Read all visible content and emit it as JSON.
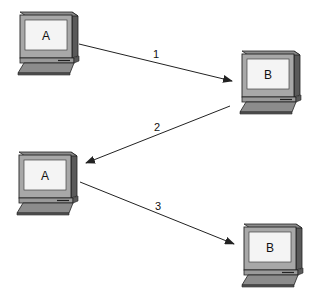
{
  "diagram": {
    "nodes": [
      {
        "id": "top-left",
        "label": "A",
        "x": 20,
        "y": 12
      },
      {
        "id": "top-right",
        "label": "B",
        "x": 242,
        "y": 51
      },
      {
        "id": "mid-left",
        "label": "A",
        "x": 19,
        "y": 152
      },
      {
        "id": "bottom-right",
        "label": "B",
        "x": 244,
        "y": 224
      }
    ],
    "arrows": [
      {
        "step": "1",
        "from": "top-left A",
        "to": "top-right B"
      },
      {
        "step": "2",
        "from": "top-right B",
        "to": "mid-left A"
      },
      {
        "step": "3",
        "from": "mid-left A",
        "to": "bottom-right B"
      }
    ],
    "colors": {
      "case_light": "#a8a8a8",
      "case_mid": "#8c8c8c",
      "case_dark": "#5a5a5a",
      "screen": "#f4f4f4",
      "outline": "#222222",
      "arrow": "#222222"
    }
  }
}
